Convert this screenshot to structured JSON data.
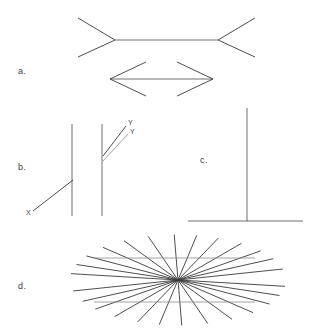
{
  "sheet": {
    "title": "Optical illusion figure plate",
    "background_color": "#ffffff",
    "line_color": "#3a3a3a",
    "faint_line_color": "#8a8a8a",
    "text_color": "#3f3f3f"
  },
  "panels": [
    {
      "key": "a",
      "label": "a.",
      "name": "muller-lyer-panel",
      "label_x": 18,
      "label_y": 74
    },
    {
      "key": "b",
      "label": "b.",
      "name": "poggendorff-panel",
      "label_x": 18,
      "label_y": 170
    },
    {
      "key": "c",
      "label": "c.",
      "name": "horizontal-vertical-panel",
      "label_x": 200,
      "label_y": 163
    },
    {
      "key": "d",
      "label": "d.",
      "name": "hering-panel",
      "label_x": 18,
      "label_y": 289
    }
  ],
  "point_labels": [
    {
      "text": "X",
      "x": 26,
      "y": 215,
      "name": "point-label-x"
    },
    {
      "text": "Y",
      "x": 128,
      "y": 125,
      "name": "point-label-y-upper"
    },
    {
      "text": "Y",
      "x": 130,
      "y": 134,
      "name": "point-label-y-lower"
    }
  ],
  "figure_a": {
    "name": "muller-lyer",
    "shaft_top": {
      "x1": 115,
      "y1": 40,
      "x2": 218,
      "y2": 40
    },
    "fins_top": [
      {
        "x1": 115,
        "y1": 40,
        "x2": 78,
        "y2": 18
      },
      {
        "x1": 115,
        "y1": 40,
        "x2": 78,
        "y2": 57
      },
      {
        "x1": 218,
        "y1": 40,
        "x2": 255,
        "y2": 18
      },
      {
        "x1": 218,
        "y1": 40,
        "x2": 255,
        "y2": 57
      }
    ],
    "shaft_bottom": {
      "x1": 110,
      "y1": 79,
      "x2": 213,
      "y2": 79
    },
    "fins_bottom": [
      {
        "x1": 110,
        "y1": 79,
        "x2": 146,
        "y2": 62
      },
      {
        "x1": 110,
        "y1": 79,
        "x2": 146,
        "y2": 96
      },
      {
        "x1": 213,
        "y1": 79,
        "x2": 177,
        "y2": 62
      },
      {
        "x1": 213,
        "y1": 79,
        "x2": 177,
        "y2": 96
      }
    ]
  },
  "figure_b": {
    "name": "poggendorff",
    "verticals": [
      {
        "x1": 72,
        "y1": 124,
        "x2": 72,
        "y2": 216
      },
      {
        "x1": 102,
        "y1": 124,
        "x2": 102,
        "y2": 216
      }
    ],
    "transversal_x": {
      "x1": 33,
      "y1": 211,
      "x2": 73,
      "y2": 180
    },
    "transversal_y_upper": {
      "x1": 103,
      "y1": 156,
      "x2": 126,
      "y2": 126
    },
    "transversal_y_lower": {
      "x1": 103,
      "y1": 161,
      "x2": 128,
      "y2": 134
    }
  },
  "figure_c": {
    "name": "horizontal-vertical",
    "vertical": {
      "x1": 247,
      "y1": 108,
      "x2": 247,
      "y2": 221
    },
    "horizontal": {
      "x1": 188,
      "y1": 221,
      "x2": 303,
      "y2": 221
    }
  },
  "figure_d": {
    "name": "hering",
    "center": {
      "x": 178,
      "y": 280
    },
    "ray_length": 108,
    "ray_angles_deg": [
      8,
      20,
      32,
      46,
      60,
      74,
      88,
      100,
      112,
      126,
      140,
      152,
      166,
      188,
      200,
      212,
      226,
      240,
      254,
      268,
      280,
      292,
      306,
      320,
      332,
      346
    ],
    "horizontals": [
      {
        "x1": 94,
        "y1": 258,
        "x2": 255,
        "y2": 258
      },
      {
        "x1": 94,
        "y1": 302,
        "x2": 255,
        "y2": 302
      }
    ]
  }
}
